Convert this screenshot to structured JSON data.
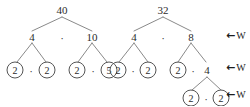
{
  "figure": {
    "background_color": "#ffffff",
    "ink_color": "#2b2b2b",
    "trees": [
      {
        "name": "factor-tree-40",
        "root": "40",
        "levels": [
          {
            "label": "level-1",
            "nodes": [
              "40"
            ]
          },
          {
            "label": "level-2",
            "nodes": [
              "4",
              "10"
            ],
            "operator": "·"
          },
          {
            "label": "level-3",
            "nodes": [
              "2",
              "2",
              "2",
              "5"
            ],
            "operators": [
              "·",
              "·"
            ]
          }
        ],
        "nodes": [
          {
            "id": "n40",
            "text": "40",
            "x": 62,
            "y": 10,
            "circled": false
          },
          {
            "id": "n4",
            "text": "4",
            "x": 32,
            "y": 37,
            "circled": false
          },
          {
            "id": "n10",
            "text": "10",
            "x": 92,
            "y": 37,
            "circled": false
          },
          {
            "id": "l2a",
            "text": "2",
            "x": 15,
            "y": 70,
            "circled": true
          },
          {
            "id": "l2b",
            "text": "2",
            "x": 47,
            "y": 70,
            "circled": true
          },
          {
            "id": "l2c",
            "text": "2",
            "x": 77,
            "y": 70,
            "circled": true
          },
          {
            "id": "l5",
            "text": "5",
            "x": 109,
            "y": 70,
            "circled": true
          }
        ],
        "dots": [
          {
            "id": "d-root",
            "text": "·",
            "x": 62,
            "y": 38
          },
          {
            "id": "d-l1",
            "text": "·",
            "x": 31,
            "y": 71
          },
          {
            "id": "d-l2",
            "text": "·",
            "x": 93,
            "y": 71
          }
        ],
        "edges": [
          [
            62,
            17,
            32,
            31
          ],
          [
            62,
            17,
            92,
            31
          ],
          [
            32,
            43,
            17,
            62
          ],
          [
            32,
            43,
            46,
            62
          ],
          [
            92,
            43,
            78,
            62
          ],
          [
            92,
            43,
            107,
            62
          ]
        ]
      },
      {
        "name": "factor-tree-32",
        "root": "32",
        "levels": [
          {
            "label": "level-1",
            "nodes": [
              "32"
            ]
          },
          {
            "label": "level-2",
            "nodes": [
              "4",
              "8"
            ],
            "operator": "·"
          },
          {
            "label": "level-3",
            "nodes": [
              "2",
              "2",
              "2",
              "4"
            ],
            "operators": [
              "·",
              "·"
            ]
          },
          {
            "label": "level-4",
            "nodes": [
              "2",
              "2"
            ],
            "operators": [
              "·"
            ]
          }
        ],
        "nodes": [
          {
            "id": "m32",
            "text": "32",
            "x": 163,
            "y": 10,
            "circled": false
          },
          {
            "id": "m4",
            "text": "4",
            "x": 134,
            "y": 37,
            "circled": false
          },
          {
            "id": "m8",
            "text": "8",
            "x": 191,
            "y": 37,
            "circled": false
          },
          {
            "id": "k2a",
            "text": "2",
            "x": 118,
            "y": 70,
            "circled": true
          },
          {
            "id": "k2b",
            "text": "2",
            "x": 148,
            "y": 70,
            "circled": true
          },
          {
            "id": "k2c",
            "text": "2",
            "x": 178,
            "y": 70,
            "circled": true
          },
          {
            "id": "k4",
            "text": "4",
            "x": 207,
            "y": 70,
            "circled": false
          },
          {
            "id": "b2a",
            "text": "2",
            "x": 191,
            "y": 98,
            "circled": true
          },
          {
            "id": "b2b",
            "text": "2",
            "x": 221,
            "y": 98,
            "circled": true
          }
        ],
        "dots": [
          {
            "id": "md-root",
            "text": "·",
            "x": 163,
            "y": 38
          },
          {
            "id": "md-l1",
            "text": "·",
            "x": 133,
            "y": 71
          },
          {
            "id": "md-l2",
            "text": "·",
            "x": 193,
            "y": 71
          },
          {
            "id": "md-l3",
            "text": "·",
            "x": 206,
            "y": 99
          }
        ],
        "edges": [
          [
            163,
            17,
            134,
            31
          ],
          [
            163,
            17,
            191,
            31
          ],
          [
            134,
            43,
            119,
            62
          ],
          [
            134,
            43,
            148,
            62
          ],
          [
            191,
            43,
            178,
            62
          ],
          [
            191,
            43,
            206,
            62
          ],
          [
            207,
            77,
            192,
            90
          ],
          [
            207,
            77,
            221,
            90
          ]
        ]
      }
    ],
    "annotations": [
      {
        "id": "ann-1",
        "arrow": "←",
        "label": "W",
        "x": 226,
        "y": 36,
        "icon": "left-arrow-icon"
      },
      {
        "id": "ann-2",
        "arrow": "←",
        "label": "W",
        "x": 226,
        "y": 68,
        "icon": "left-arrow-icon"
      },
      {
        "id": "ann-3",
        "arrow": "←",
        "label": "W",
        "x": 226,
        "y": 95,
        "icon": "left-arrow-icon"
      }
    ]
  }
}
